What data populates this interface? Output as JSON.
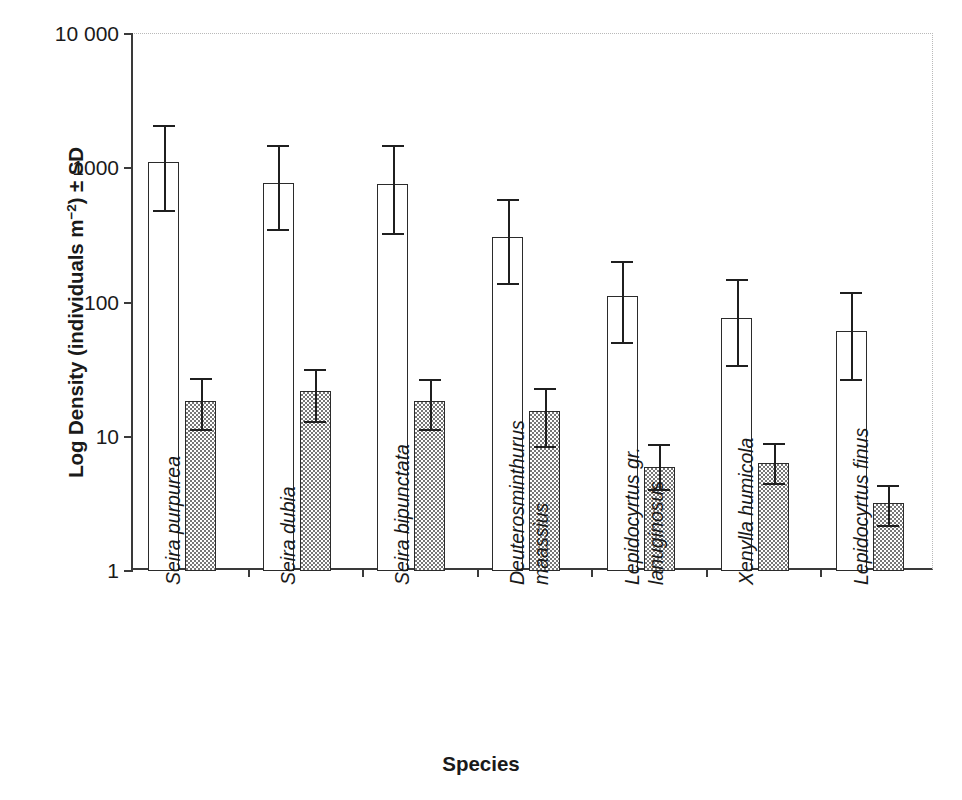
{
  "chart_data": {
    "type": "bar",
    "title": "",
    "xlabel": "Species",
    "ylabel": "Log Density (individuals m⁻²) ± SD",
    "yscale": "log",
    "ylim": [
      1,
      10000
    ],
    "ytick_labels": [
      "1",
      "10",
      "100",
      "1000",
      "10 000"
    ],
    "ytick_values": [
      1,
      10,
      100,
      1000,
      10000
    ],
    "grid": false,
    "legend_position": "none",
    "categories": [
      "Seira purpurea",
      "Seira dubia",
      "Seira bipunctata",
      "Deuterosminthurus maassius",
      "Lepidocyrtus gr. lanuginosus",
      "Xenylla humicola",
      "Lepidocyrtus finus"
    ],
    "category_lines": [
      [
        "Seira purpurea"
      ],
      [
        "Seira dubia"
      ],
      [
        "Seira bipunctata"
      ],
      [
        "Deuterosminthurus",
        "maassius"
      ],
      [
        "Lepidocyrtus gr.",
        "lanuginosus"
      ],
      [
        "Xenylla humicola"
      ],
      [
        "Lepidocyrtus finus"
      ]
    ],
    "series": [
      {
        "name": "white-bars",
        "fill": "white",
        "values": [
          1110,
          780,
          760,
          310,
          112,
          77,
          61
        ],
        "err_upper": [
          2090,
          1490,
          1480,
          590,
          205,
          150,
          120
        ],
        "err_lower": [
          490,
          350,
          330,
          140,
          51,
          34,
          27
        ]
      },
      {
        "name": "hatched-bars",
        "fill": "gray-checker",
        "values": [
          18.6,
          22.0,
          18.6,
          15.6,
          6.0,
          6.4,
          3.2
        ],
        "err_upper": [
          27.5,
          32.0,
          27.0,
          23.0,
          8.8,
          9.0,
          4.4
        ],
        "err_lower": [
          11.5,
          13.0,
          11.5,
          8.6,
          4.1,
          4.5,
          2.2
        ]
      }
    ]
  },
  "axes": {
    "y_title_prefix": "Log Density (individuals m",
    "y_title_sup": "−2",
    "y_title_suffix": ") ± SD",
    "x_title": "Species"
  },
  "colors": {
    "axis": "#3a3a3a",
    "frame_light": "#b9b9b9",
    "bar_outline": "#2b2b2b",
    "bar_white_fill": "#ffffff",
    "bar_hatch_fill": "#777777",
    "error_bar": "#1f1f1f",
    "text": "#1a1a1a"
  }
}
